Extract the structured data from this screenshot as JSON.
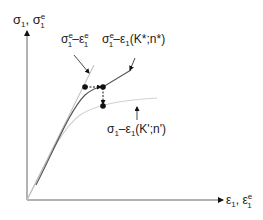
{
  "diagram": {
    "axes": {
      "y_label_main": "σ",
      "y_label_sub1": "1",
      "y_label_sep": ", σ",
      "y_label_sup": "e",
      "y_label_sub2": "1",
      "x_label_main": "ε",
      "x_label_sub1": "1",
      "x_label_sep": ", ε",
      "x_label_sup": "e",
      "x_label_sub2": "1"
    },
    "curves": [
      {
        "id": "elastic-estimate",
        "label": "σ1e–ε1e",
        "color": "#b5b5b5"
      },
      {
        "id": "neuber-curve",
        "label": "σ1e–ε1(K*;n*)",
        "color": "#555555"
      },
      {
        "id": "cyclic-curve",
        "label": "σ1–ε1(K';n')",
        "color": "#d8d8d8"
      }
    ],
    "labels": {
      "curve1": {
        "s": "σ",
        "sup1": "e",
        "sub1": "1",
        "dash": "–",
        "e": "ε",
        "sup2": "e",
        "sub2": "1"
      },
      "curve2": {
        "s": "σ",
        "sup1": "e",
        "sub1": "1",
        "rest": "–ε",
        "sub2": "1",
        "tail": "(K*;n*)"
      },
      "curve3": {
        "s": "σ",
        "sub1": "1",
        "rest": "–ε",
        "sub2": "1",
        "tail": "(K';n')"
      }
    }
  }
}
